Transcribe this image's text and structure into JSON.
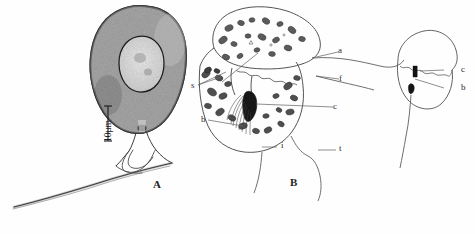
{
  "figure": {
    "background_color": "#fefefe",
    "ink_color": "#2b2b2b",
    "width": 475,
    "height": 234
  },
  "panel_a": {
    "label": "A",
    "scale_bar": {
      "text": "10μm",
      "orientation": "vertical"
    },
    "description_icons": {
      "cell_body": "micrograph-cell-icon",
      "nucleus": "nucleus-outline-icon",
      "flagellum_long": "long-flagellum-icon",
      "flagellum_short": "short-flagellum-icon"
    }
  },
  "panel_b": {
    "label": "B",
    "labels": [
      {
        "text": "s",
        "name": "label-s"
      },
      {
        "text": "a",
        "name": "label-a"
      },
      {
        "text": "f",
        "name": "label-f"
      },
      {
        "text": "b",
        "name": "label-b"
      },
      {
        "text": "c",
        "name": "label-c"
      },
      {
        "text": "i",
        "name": "label-i"
      },
      {
        "text": "t",
        "name": "label-t"
      }
    ],
    "description_icons": {
      "anterior_lobe": "anterior-lobe-outline-icon",
      "posterior_lobe": "posterior-lobe-outline-icon",
      "granules": "granule-cluster-icon",
      "flagellar_root": "flagellar-root-brush-icon"
    }
  },
  "panel_c": {
    "labels": [
      {
        "text": "c",
        "name": "label-c-right"
      },
      {
        "text": "b",
        "name": "label-b-right"
      }
    ],
    "description_icons": {
      "detail_outline": "detail-cell-outline-icon",
      "dark_body_upper": "dark-rod-icon",
      "dark_body_lower": "dark-basal-body-icon",
      "flagellum": "detail-flagellum-icon"
    }
  }
}
